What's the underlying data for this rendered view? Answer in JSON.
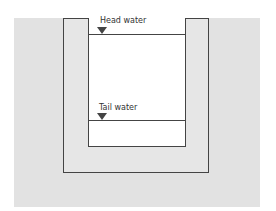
{
  "diagram": {
    "type": "channel cross-section",
    "labels": {
      "head_water": "Head water",
      "tail_water": "Tail water"
    },
    "colors": {
      "ground": "#e2e2e2",
      "wall": "#e6e6e6",
      "water_area": "#ffffff",
      "lines": "#444444"
    }
  }
}
